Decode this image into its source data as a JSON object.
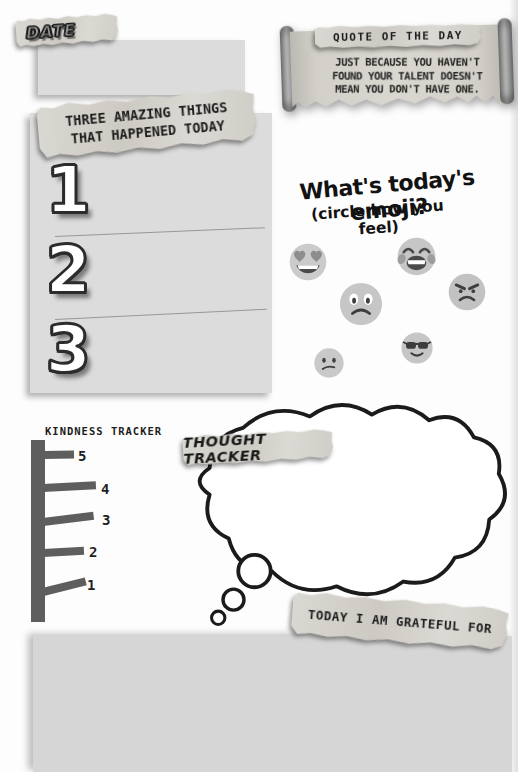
{
  "page": {
    "background": "#ffffff",
    "width": 518,
    "height": 772
  },
  "date": {
    "label": "DATE"
  },
  "quote": {
    "title": "QUOTE OF THE DAY",
    "lines": [
      "JUST BECAUSE YOU HAVEN'T",
      "FOUND YOUR TALENT DOESN'T",
      "MEAN YOU DON'T HAVE ONE."
    ]
  },
  "amazing": {
    "title_line1": "THREE AMAZING THINGS",
    "title_line2": "THAT HAPPENED TODAY",
    "items": [
      {
        "number": "1"
      },
      {
        "number": "2"
      },
      {
        "number": "3"
      }
    ]
  },
  "emoji_section": {
    "title": "What's today's emoji?",
    "subtitle": "(circle how you feel)",
    "options": [
      {
        "name": "heart-eyes"
      },
      {
        "name": "laughing-tears"
      },
      {
        "name": "frowning"
      },
      {
        "name": "angry"
      },
      {
        "name": "confused"
      },
      {
        "name": "cool-sunglasses"
      }
    ]
  },
  "kindness": {
    "title": "KINDNESS TRACKER",
    "levels": [
      "5",
      "4",
      "3",
      "2",
      "1"
    ]
  },
  "thought": {
    "title": "THOUGHT TRACKER"
  },
  "grateful": {
    "title": "TODAY I AM GRATEFUL FOR"
  },
  "colors": {
    "panel_gray": "#dcdcdc",
    "tape": "#d3d1cb",
    "ink": "#1d1d1d",
    "emoji_face": "#c6c6c6",
    "emoji_feature": "#4a4a4a",
    "tracker_bar": "#5e5e5e",
    "cloud_stroke": "#1b1b1b"
  }
}
